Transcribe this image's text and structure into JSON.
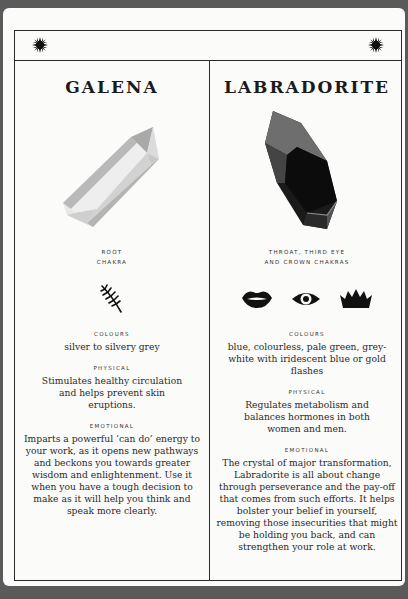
{
  "header": {
    "left_icon": "sun-icon",
    "center_icon": "crescent-moon-icon",
    "right_icon": "sun-icon"
  },
  "crystals": [
    {
      "name": "GALENA",
      "image": "clear-quartz-point-crystal",
      "chakra": [
        "ROOT",
        "CHAKRA"
      ],
      "chakra_icons": [
        "root-sprig-icon"
      ],
      "colours_label": "COLOURS",
      "colours": "silver to silvery grey",
      "physical_label": "PHYSICAL",
      "physical": "Stimulates healthy circulation and helps prevent skin eruptions.",
      "emotional_label": "EMOTIONAL",
      "emotional": "Imparts a powerful ‘can do’ energy to your work, as it opens new pathways and beckons you towards greater wisdom and enlightenment. Use it when you have a tough decision to make as it will help you think and speak more clearly."
    },
    {
      "name": "LABRADORITE",
      "image": "dark-labradorite-crystal",
      "chakra": [
        "THROAT, THIRD EYE",
        "AND CROWN CHAKRAS"
      ],
      "chakra_icons": [
        "lips-icon",
        "eye-icon",
        "crown-icon"
      ],
      "colours_label": "COLOURS",
      "colours": "blue, colourless, pale green, grey-white with iridescent blue or gold flashes",
      "physical_label": "PHYSICAL",
      "physical": "Regulates metabolism and balances hormones in both women and men.",
      "emotional_label": "EMOTIONAL",
      "emotional": "The crystal of major transformation, Labradorite is all about change through perseverance and the pay-off that comes from such efforts. It helps bolster your belief in yourself, removing those insecurities that might be holding you back, and can strengthen your role at work."
    }
  ],
  "colors": {
    "background": "#5a5a5a",
    "card": "#fbfbfa",
    "ink": "#2a2a2a"
  }
}
